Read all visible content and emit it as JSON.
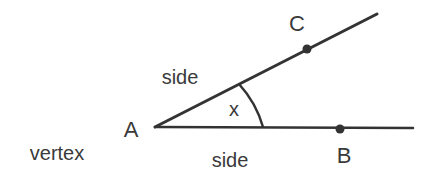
{
  "diagram": {
    "type": "angle",
    "colors": {
      "line": "#333333",
      "text": "#3a3a3a",
      "background": "#ffffff"
    },
    "labels": {
      "vertex_point": "A",
      "point_upper": "C",
      "point_lower": "B",
      "angle": "x",
      "side_upper": "side",
      "side_lower": "side",
      "vertex_caption": "vertex"
    }
  }
}
